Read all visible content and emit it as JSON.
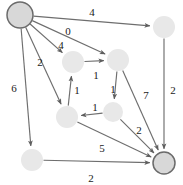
{
  "figure": {
    "background_color": "#ffffff",
    "edge_color": "#6e6e6e",
    "node_fill": "#e8e8e8",
    "terminal_node_fill": "#d8d8d8",
    "terminal_node_stroke": "#6b6b6b",
    "label_color": "#1a1a1a"
  },
  "chart_data": {
    "type": "diagram",
    "diagram_kind": "directed-weighted-graph",
    "title": "",
    "nodes": [
      {
        "id": "source",
        "cx": 20,
        "cy": 15,
        "r": 13,
        "style": "terminal",
        "label": ""
      },
      {
        "id": "topright",
        "cx": 164,
        "cy": 27,
        "r": 11,
        "style": "plain",
        "label": ""
      },
      {
        "id": "mid_ul",
        "cx": 73,
        "cy": 62,
        "r": 11,
        "style": "plain",
        "label": ""
      },
      {
        "id": "mid_ur",
        "cx": 118,
        "cy": 60,
        "r": 11,
        "style": "plain",
        "label": ""
      },
      {
        "id": "mid_ll",
        "cx": 67,
        "cy": 117,
        "r": 11,
        "style": "plain",
        "label": ""
      },
      {
        "id": "mid_lr",
        "cx": 113,
        "cy": 112,
        "r": 10,
        "style": "plain",
        "label": ""
      },
      {
        "id": "botleft",
        "cx": 32,
        "cy": 160,
        "r": 11,
        "style": "plain",
        "label": ""
      },
      {
        "id": "sink",
        "cx": 164,
        "cy": 163,
        "r": 11,
        "style": "terminal",
        "label": ""
      }
    ],
    "edges": [
      {
        "from": "source",
        "to": "topright",
        "weight": "4",
        "label_x": 92,
        "label_y": 12
      },
      {
        "from": "source",
        "to": "mid_ur",
        "weight": "0",
        "label_x": 68,
        "label_y": 31
      },
      {
        "from": "source",
        "to": "mid_ul",
        "weight": "4",
        "label_x": 61,
        "label_y": 45
      },
      {
        "from": "source",
        "to": "mid_ll",
        "weight": "2",
        "label_x": 40,
        "label_y": 62
      },
      {
        "from": "source",
        "to": "botleft",
        "weight": "6",
        "label_x": 14,
        "label_y": 88
      },
      {
        "from": "topright",
        "to": "sink",
        "weight": "2",
        "label_x": 173,
        "label_y": 90
      },
      {
        "from": "mid_ul",
        "to": "mid_ur",
        "weight": "1",
        "label_x": 96,
        "label_y": 75
      },
      {
        "from": "mid_ur",
        "to": "mid_lr",
        "weight": "1",
        "label_x": 113,
        "label_y": 89
      },
      {
        "from": "mid_lr",
        "to": "mid_ll",
        "weight": "1",
        "label_x": 95,
        "label_y": 107
      },
      {
        "from": "mid_ll",
        "to": "mid_ul",
        "weight": "1",
        "label_x": 77,
        "label_y": 90
      },
      {
        "from": "mid_ur",
        "to": "sink",
        "weight": "7",
        "label_x": 146,
        "label_y": 95
      },
      {
        "from": "mid_lr",
        "to": "sink",
        "weight": "2",
        "label_x": 139,
        "label_y": 130
      },
      {
        "from": "mid_ll",
        "to": "sink",
        "weight": "5",
        "label_x": 102,
        "label_y": 148
      },
      {
        "from": "botleft",
        "to": "sink",
        "weight": "2",
        "label_x": 91,
        "label_y": 178
      }
    ],
    "node_count": 8,
    "edge_count": 14,
    "weights": [
      "4",
      "0",
      "4",
      "2",
      "6",
      "2",
      "1",
      "1",
      "1",
      "1",
      "7",
      "2",
      "5",
      "2"
    ]
  }
}
